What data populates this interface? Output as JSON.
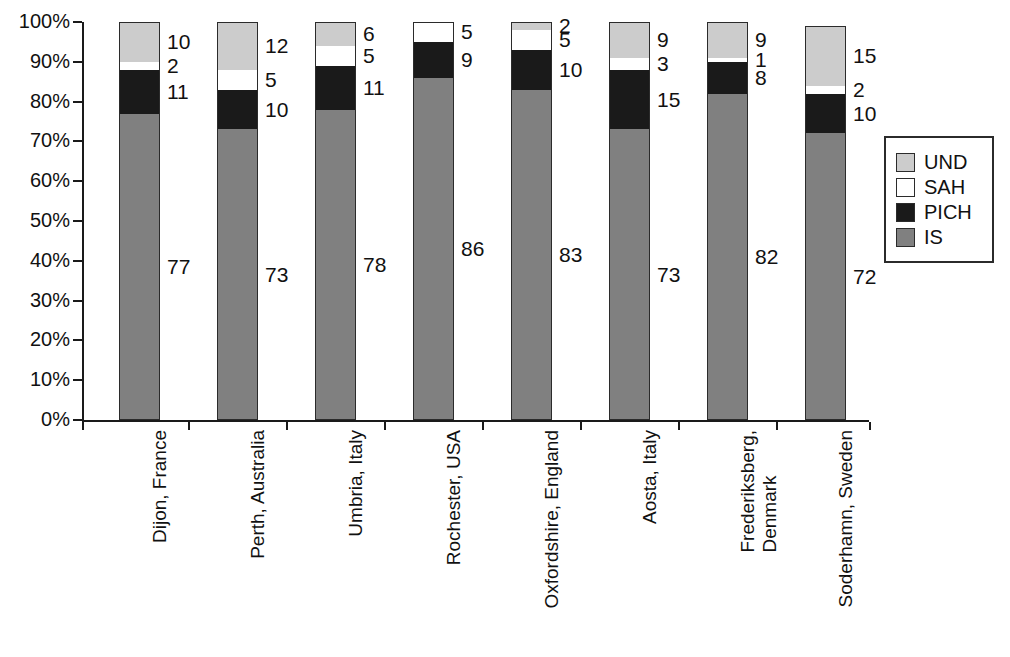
{
  "chart_data": {
    "type": "bar",
    "subtype": "stacked-percentage",
    "title": "",
    "xlabel": "",
    "ylabel": "",
    "ylim": [
      0,
      100
    ],
    "ytick_labels": [
      "0%",
      "10%",
      "20%",
      "30%",
      "40%",
      "50%",
      "60%",
      "70%",
      "80%",
      "90%",
      "100%"
    ],
    "ytick_values": [
      0,
      10,
      20,
      30,
      40,
      50,
      60,
      70,
      80,
      90,
      100
    ],
    "grid": false,
    "legend_position": "right",
    "stack_order_bottom_to_top": [
      "IS",
      "PICH",
      "SAH",
      "UND"
    ],
    "categories": [
      "Dijon, France",
      "Perth, Australia",
      "Umbria, Italy",
      "Rochester, USA",
      "Oxfordshire, England",
      "Aosta, Italy",
      "Frederiksberg, Denmark",
      "Soderhamn, Sweden"
    ],
    "series": [
      {
        "name": "IS",
        "color": "#808080",
        "values": [
          77,
          73,
          78,
          86,
          83,
          73,
          82,
          72
        ]
      },
      {
        "name": "PICH",
        "color": "#1a1a1a",
        "values": [
          11,
          10,
          11,
          9,
          10,
          15,
          8,
          10
        ]
      },
      {
        "name": "SAH",
        "color": "#ffffff",
        "values": [
          2,
          5,
          5,
          5,
          5,
          3,
          1,
          2
        ]
      },
      {
        "name": "UND",
        "color": "#cccccc",
        "values": [
          10,
          12,
          6,
          0,
          2,
          9,
          9,
          15
        ]
      }
    ],
    "legend_entries": [
      {
        "label": "UND",
        "color": "#cccccc"
      },
      {
        "label": "SAH",
        "color": "#ffffff"
      },
      {
        "label": "PICH",
        "color": "#1a1a1a"
      },
      {
        "label": "IS",
        "color": "#808080"
      }
    ],
    "bar_labels": [
      {
        "category": "Dijon, France",
        "labels": [
          "10",
          "2",
          "11",
          "77"
        ]
      },
      {
        "category": "Perth, Australia",
        "labels": [
          "12",
          "5",
          "10",
          "73"
        ]
      },
      {
        "category": "Umbria, Italy",
        "labels": [
          "6",
          "5",
          "11",
          "78"
        ]
      },
      {
        "category": "Rochester, USA",
        "labels": [
          "5",
          "9",
          "86"
        ]
      },
      {
        "category": "Oxfordshire, England",
        "labels": [
          "2",
          "5",
          "10",
          "83"
        ]
      },
      {
        "category": "Aosta, Italy",
        "labels": [
          "9",
          "3",
          "15",
          "73"
        ]
      },
      {
        "category": "Frederiksberg, Denmark",
        "labels": [
          "9",
          "1",
          "8",
          "82"
        ]
      },
      {
        "category": "Soderhamn, Sweden",
        "labels": [
          "15",
          "2",
          "10",
          "72"
        ]
      }
    ],
    "category_label_lines": [
      [
        "Dijon, France"
      ],
      [
        "Perth, Australia"
      ],
      [
        "Umbria, Italy"
      ],
      [
        "Rochester, USA"
      ],
      [
        "Oxfordshire, England"
      ],
      [
        "Aosta, Italy"
      ],
      [
        "Frederiksberg,",
        "Denmark"
      ],
      [
        "Soderhamn, Sweden"
      ]
    ]
  }
}
